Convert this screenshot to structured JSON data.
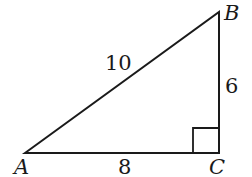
{
  "diagram": {
    "type": "right-triangle",
    "vertices": [
      {
        "label": "A",
        "x": 25,
        "y": 153
      },
      {
        "label": "B",
        "x": 219,
        "y": 12
      },
      {
        "label": "C",
        "x": 219,
        "y": 153
      }
    ],
    "sides": [
      {
        "from": "A",
        "to": "B",
        "length_label": "10"
      },
      {
        "from": "B",
        "to": "C",
        "length_label": "6"
      },
      {
        "from": "A",
        "to": "C",
        "length_label": "8"
      }
    ],
    "right_angle_at": "C",
    "stroke_color": "#1a1a1a"
  }
}
